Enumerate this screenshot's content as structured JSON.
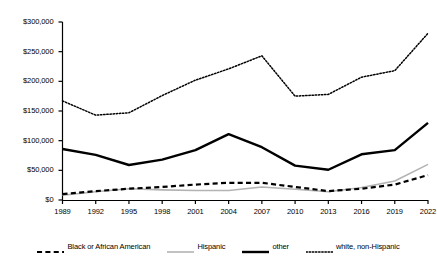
{
  "chart_data": {
    "type": "line",
    "title": "",
    "xlabel": "",
    "ylabel": "",
    "x": [
      1989,
      1992,
      1995,
      1998,
      2001,
      2004,
      2007,
      2010,
      2013,
      2016,
      2019,
      2022
    ],
    "categories": [
      "1989",
      "1992",
      "1995",
      "1998",
      "2001",
      "2004",
      "2007",
      "2010",
      "2013",
      "2016",
      "2019",
      "2022"
    ],
    "ylim": [
      0,
      300000
    ],
    "ytick_values": [
      0,
      50000,
      100000,
      150000,
      200000,
      250000,
      300000
    ],
    "ytick_labels": [
      "$0",
      "$50,000",
      "$100,000",
      "$150,000",
      "$200,000",
      "$250,000",
      "$300,000"
    ],
    "grid": false,
    "legend_position": "bottom",
    "series": [
      {
        "name": "Black or African American",
        "style": "dashed",
        "color": "#000000",
        "width": 2.2,
        "values": [
          10000,
          15000,
          19000,
          22000,
          26000,
          29000,
          29000,
          22000,
          15000,
          19000,
          26000,
          42000
        ]
      },
      {
        "name": "Hispanic",
        "style": "solid",
        "color": "#b3b3b3",
        "width": 1.6,
        "values": [
          8000,
          14000,
          19000,
          17000,
          16000,
          16000,
          22000,
          18000,
          14000,
          21000,
          32000,
          60000
        ]
      },
      {
        "name": "other",
        "style": "solid",
        "color": "#000000",
        "width": 2.4,
        "values": [
          86000,
          76000,
          59000,
          68000,
          84000,
          111000,
          89000,
          58000,
          51000,
          77000,
          84000,
          130000
        ]
      },
      {
        "name": "white, non-Hispanic",
        "style": "dotted",
        "color": "#000000",
        "width": 1.5,
        "values": [
          167000,
          143000,
          147000,
          176000,
          202000,
          221000,
          243000,
          175000,
          178000,
          207000,
          218000,
          281000
        ]
      }
    ]
  },
  "legend": {
    "items": [
      {
        "label": "Black or African American",
        "swatch": "dashed-black-line"
      },
      {
        "label": "Hispanic",
        "swatch": "solid-gray-line"
      },
      {
        "label": "other",
        "swatch": "solid-black-thick-line"
      },
      {
        "label": "white, non-Hispanic",
        "swatch": "dotted-black-line"
      }
    ]
  }
}
